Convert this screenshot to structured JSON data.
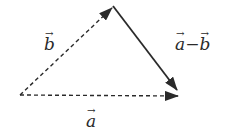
{
  "diagram": {
    "colors": {
      "stroke": "#2a2a2a",
      "background": "#ffffff"
    },
    "points": {
      "origin": [
        20,
        95
      ],
      "apex": [
        113,
        6
      ],
      "end": [
        178,
        96
      ]
    },
    "vectors": [
      {
        "id": "a",
        "from": "origin",
        "to": "end",
        "style": "dashed",
        "label": "a"
      },
      {
        "id": "b",
        "from": "origin",
        "to": "apex",
        "style": "dashed",
        "label": "b"
      },
      {
        "id": "a_minus_b",
        "from": "apex",
        "to": "end",
        "style": "solid",
        "label": "a−b"
      }
    ],
    "labels": {
      "a": "a",
      "b": "b",
      "diff_a": "a",
      "diff_minus": "−",
      "diff_b": "b",
      "arrow": "→"
    }
  }
}
